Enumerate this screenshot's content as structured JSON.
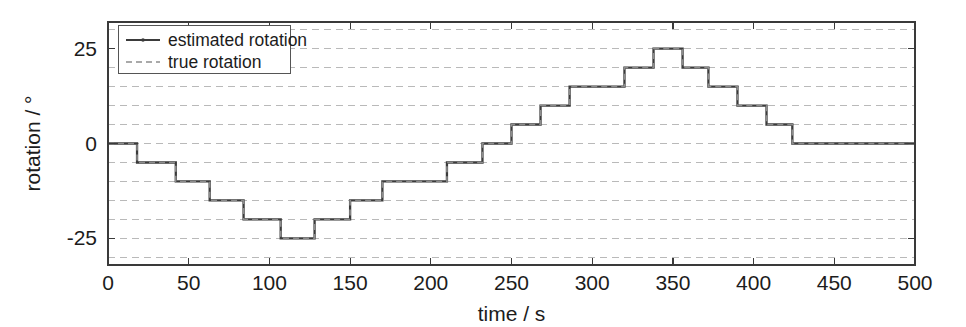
{
  "figure": {
    "background": "#ffffff",
    "width": 966,
    "height": 327
  },
  "axes": {
    "frame_color": "#3a3a3a",
    "grid_color": "#b9b9b9",
    "plot_box": {
      "left": 108,
      "top": 22,
      "right": 915,
      "bottom": 265
    }
  },
  "labels": {
    "xlabel": "time / s",
    "ylabel": "rotation / °",
    "xticks": [
      "0",
      "50",
      "100",
      "150",
      "200",
      "250",
      "300",
      "350",
      "400",
      "450",
      "500"
    ],
    "yticks": [
      "25",
      "0",
      "-25"
    ]
  },
  "legend": {
    "position": "top-left",
    "border_color": "#555555",
    "entries": [
      {
        "label": "estimated rotation",
        "style": "solid-marker",
        "color": "#3b3b3b"
      },
      {
        "label": "true rotation",
        "style": "dashed",
        "color": "#8d8d8d"
      }
    ]
  },
  "chart_data": {
    "type": "line",
    "title": "",
    "xlabel": "time / s",
    "ylabel": "rotation / °",
    "xlim": [
      0,
      500
    ],
    "ylim": [
      -32,
      32
    ],
    "xticks": [
      0,
      50,
      100,
      150,
      200,
      250,
      300,
      350,
      400,
      450,
      500
    ],
    "yticks": [
      25,
      0,
      -25
    ],
    "grid": true,
    "grid_minor_y_step": 5,
    "drawstyle": "steps-post",
    "series": [
      {
        "name": "estimated rotation",
        "color": "#3b3b3b",
        "style": "solid",
        "x": [
          0,
          18,
          42,
          63,
          84,
          107,
          128,
          150,
          170,
          190,
          210,
          232,
          250,
          268,
          286,
          302,
          320,
          338,
          356,
          372,
          390,
          408,
          424,
          438,
          500
        ],
        "y": [
          0,
          -5,
          -10,
          -15,
          -20,
          -25,
          -20,
          -15,
          -10,
          -10,
          -5,
          0,
          5,
          10,
          15,
          15,
          20,
          25,
          20,
          15,
          10,
          5,
          0,
          0,
          0
        ]
      },
      {
        "name": "true rotation",
        "color": "#8d8d8d",
        "style": "dashed",
        "x": [
          0,
          18,
          42,
          63,
          84,
          107,
          128,
          150,
          170,
          190,
          210,
          232,
          250,
          268,
          286,
          302,
          320,
          338,
          356,
          372,
          390,
          408,
          424,
          438,
          500
        ],
        "y": [
          0,
          -5,
          -10,
          -15,
          -20,
          -25,
          -20,
          -15,
          -10,
          -10,
          -5,
          0,
          5,
          10,
          15,
          15,
          20,
          25,
          20,
          15,
          10,
          5,
          0,
          0,
          0
        ]
      }
    ]
  }
}
